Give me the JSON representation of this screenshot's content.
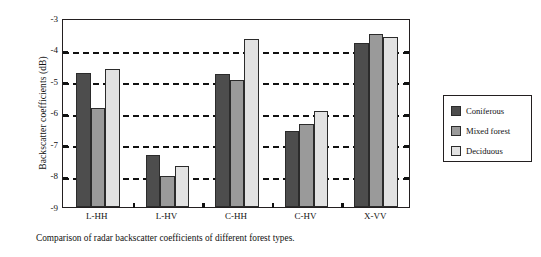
{
  "chart_data": {
    "type": "bar",
    "title": "",
    "caption": "Comparison of radar backscatter coefficients of different forest types.",
    "xlabel": "",
    "ylabel": "Backscatter coefficients (dB)",
    "categories": [
      "L-HH",
      "L-HV",
      "C-HH",
      "C-HV",
      "X-VV"
    ],
    "series": [
      {
        "name": "Coniferous",
        "color": "#4d4d4d",
        "values": [
          -4.75,
          -7.35,
          -4.78,
          -6.6,
          -3.78
        ]
      },
      {
        "name": "Mixed forest",
        "color": "#9a9a9a",
        "values": [
          -5.85,
          -8.0,
          -4.97,
          -6.38,
          -3.52
        ]
      },
      {
        "name": "Deciduous",
        "color": "#e2e2e2",
        "values": [
          -4.62,
          -7.7,
          -3.68,
          -5.95,
          -3.6
        ]
      }
    ],
    "ylim": [
      -9,
      -3
    ],
    "yticks": [
      -3,
      -4,
      -5,
      -6,
      -7,
      -8,
      -9
    ],
    "ytick_labels": [
      "-3",
      "-4",
      "-5",
      "-6",
      "-7",
      "-8",
      "-9"
    ],
    "gridlines": [
      -4,
      -5,
      -6,
      -7,
      -8
    ],
    "grid": true,
    "grid_style": "dashed",
    "legend_position": "right-outside",
    "frame_color": "#231f20",
    "background": "#ffffff"
  }
}
